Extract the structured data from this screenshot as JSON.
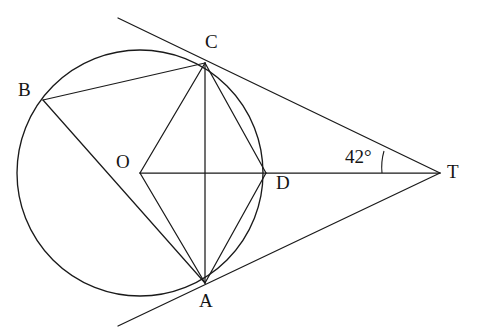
{
  "figure": {
    "type": "circle-geometry-diagram",
    "stroke_color": "#1a1a1a",
    "background_color": "#ffffff",
    "width": 477,
    "height": 334
  },
  "circle": {
    "center_label": "O",
    "center_x": 140,
    "center_y": 173,
    "radius": 123
  },
  "points": [
    {
      "id": "C",
      "label": "C",
      "x": 205,
      "y": 63,
      "label_x": 205,
      "label_y": 32,
      "on_circle": true
    },
    {
      "id": "B",
      "label": "B",
      "x": 43,
      "y": 100,
      "label_x": 18,
      "label_y": 80,
      "on_circle": true
    },
    {
      "id": "A",
      "label": "A",
      "x": 205,
      "y": 283,
      "label_x": 199,
      "label_y": 291,
      "on_circle": true
    },
    {
      "id": "D",
      "label": "D",
      "x": 266,
      "y": 173,
      "label_x": 276,
      "label_y": 173,
      "on_circle": true
    },
    {
      "id": "O",
      "label": "O",
      "x": 140,
      "y": 173,
      "label_x": 116,
      "label_y": 152,
      "on_circle": false
    },
    {
      "id": "T",
      "label": "T",
      "x": 440,
      "y": 173,
      "label_x": 447,
      "label_y": 162,
      "on_circle": false
    }
  ],
  "segments": [
    {
      "name": "chord-BC",
      "from": "B",
      "to": "C"
    },
    {
      "name": "chord-BA",
      "from": "B",
      "to": "A"
    },
    {
      "name": "chord-CA",
      "from": "C",
      "to": "A"
    },
    {
      "name": "chord-CD",
      "from": "C",
      "to": "D"
    },
    {
      "name": "chord-AD",
      "from": "A",
      "to": "D"
    },
    {
      "name": "radius-OC",
      "from": "O",
      "to": "C"
    },
    {
      "name": "radius-OA",
      "from": "O",
      "to": "A"
    },
    {
      "name": "diameter-line-OT",
      "from": "O",
      "to": "T"
    },
    {
      "name": "tangent-CT",
      "from": "C",
      "to": "T"
    },
    {
      "name": "tangent-AT",
      "from": "A",
      "to": "T"
    }
  ],
  "tangent_extensions": [
    {
      "name": "tangent-at-C-extended",
      "from_x": 118,
      "from_y": 18,
      "to_x": 440,
      "to_y": 173
    },
    {
      "name": "tangent-at-A-extended",
      "from_x": 118,
      "from_y": 326,
      "to_x": 440,
      "to_y": 173
    }
  ],
  "angle": {
    "label": "42°",
    "value": 42,
    "vertex": "T",
    "label_x": 355,
    "label_y": 147,
    "arc_center_x": 440,
    "arc_center_y": 173,
    "arc_radius": 58
  },
  "paths": {
    "circle_d": "M 17 173 A 123 123 0 1 1 263 173 A 123 123 0 1 1 17 173",
    "angle_arc_d": "M 384 151 A 58 58 0 0 0 382 173",
    "lines": [
      {
        "name": "chord-BC",
        "d": "M 43 100 L 205 63"
      },
      {
        "name": "chord-BA",
        "d": "M 43 100 L 205 283"
      },
      {
        "name": "chord-CA",
        "d": "M 205 63 L 205 283"
      },
      {
        "name": "chord-CD",
        "d": "M 205 63 L 266 173"
      },
      {
        "name": "chord-AD",
        "d": "M 205 283 L 266 173"
      },
      {
        "name": "radius-OC",
        "d": "M 140 173 L 205 63"
      },
      {
        "name": "radius-OA",
        "d": "M 140 173 L 205 283"
      },
      {
        "name": "line-OT",
        "d": "M 140 173 L 440 173"
      },
      {
        "name": "tangent-C-T",
        "d": "M 118 18 L 440 173"
      },
      {
        "name": "tangent-A-T",
        "d": "M 118 326 L 440 173"
      }
    ]
  }
}
